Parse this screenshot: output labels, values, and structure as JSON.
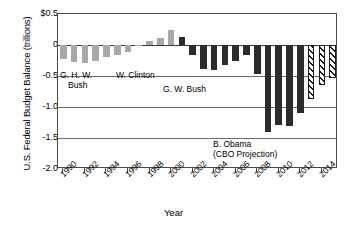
{
  "chart_data": {
    "type": "bar",
    "title": "",
    "xlabel": "Year",
    "ylabel": "U.S. Federal Budget Balance (trillions)",
    "ylim": [
      -2.0,
      0.5
    ],
    "ytick_labels": [
      "$0.5",
      "0",
      "-0.5",
      "-1.0",
      "-1.5",
      "-2.0"
    ],
    "ytick_values": [
      0.5,
      0,
      -0.5,
      -1.0,
      -1.5,
      -2.0
    ],
    "xtick_labels": [
      "1990",
      "1992",
      "1994",
      "1996",
      "1998",
      "2000",
      "2002",
      "2004",
      "2006",
      "2008",
      "2010",
      "2012",
      "2014"
    ],
    "xtick_values": [
      1990,
      1992,
      1994,
      1996,
      1998,
      2000,
      2002,
      2004,
      2006,
      2008,
      2010,
      2012,
      2014
    ],
    "grid": true,
    "legend": "none",
    "categories": [
      1990,
      1991,
      1992,
      1993,
      1994,
      1995,
      1996,
      1997,
      1998,
      1999,
      2000,
      2001,
      2002,
      2003,
      2004,
      2005,
      2006,
      2007,
      2008,
      2009,
      2010,
      2011,
      2012,
      2013,
      2014,
      2015
    ],
    "values": [
      -0.22,
      -0.27,
      -0.29,
      -0.26,
      -0.2,
      -0.16,
      -0.11,
      -0.02,
      0.07,
      0.12,
      0.24,
      0.13,
      -0.16,
      -0.38,
      -0.41,
      -0.32,
      -0.25,
      -0.16,
      -0.46,
      -1.41,
      -1.29,
      -1.3,
      -1.09,
      -0.87,
      -0.64,
      -0.54
    ],
    "styles": [
      "light",
      "light",
      "light",
      "light",
      "light",
      "light",
      "light",
      "light",
      "light",
      "light",
      "light",
      "dark",
      "dark",
      "dark",
      "dark",
      "dark",
      "dark",
      "dark",
      "dark",
      "dark",
      "dark",
      "dark",
      "dark",
      "hatch",
      "hatch",
      "hatch"
    ],
    "annotations": [
      {
        "id": "ghw-bush",
        "text_line1": "G. H. W.",
        "text_line2": "Bush"
      },
      {
        "id": "clinton",
        "text_line1": "W. Clinton",
        "text_line2": ""
      },
      {
        "id": "gw-bush",
        "text_line1": "G. W. Bush",
        "text_line2": ""
      },
      {
        "id": "obama",
        "text_line1": "B. Obama",
        "text_line2": "(CBO Projection)"
      }
    ],
    "colors": {
      "light_bar": "#a8a8a8",
      "dark_bar": "#2b2b2b",
      "projection_bar": "#ffffff",
      "axis": "#4a4a4a",
      "grid": "#6b6b6b"
    }
  }
}
